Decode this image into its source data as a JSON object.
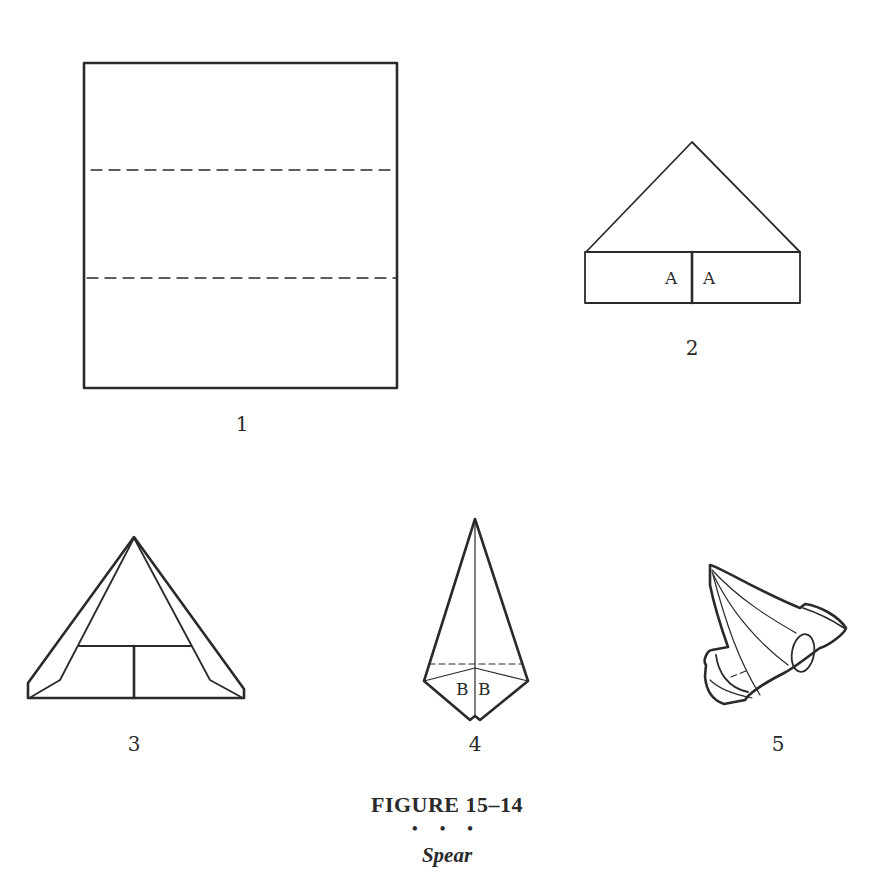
{
  "figure": {
    "title": "FIGURE 15–14",
    "separator": "• • •",
    "name": "Spear"
  },
  "steps": [
    {
      "number": "1",
      "description": "Square with two horizontal dashed fold lines"
    },
    {
      "number": "2",
      "description": "Triangle top over rectangular base divided in center",
      "labels": [
        "A",
        "A"
      ]
    },
    {
      "number": "3",
      "description": "Triangle with inner folded flaps and center divider"
    },
    {
      "number": "4",
      "description": "Kite shape with dashed fold line",
      "labels": [
        "B",
        "B"
      ]
    },
    {
      "number": "5",
      "description": "Finished spear fold (3D view)"
    }
  ],
  "colors": {
    "line": "#2a2a2a",
    "background": "#ffffff"
  }
}
